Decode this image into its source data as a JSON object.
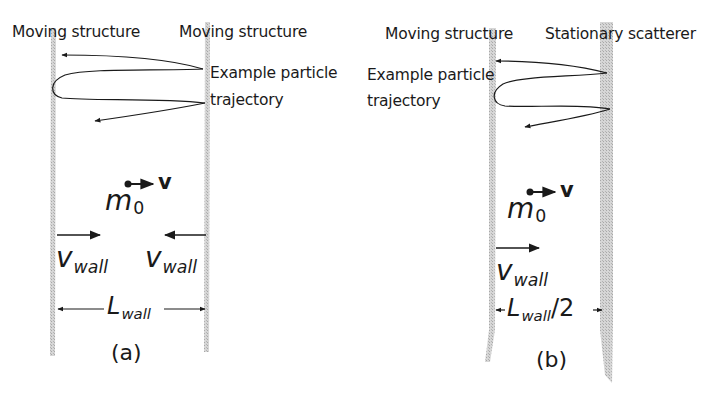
{
  "figure": {
    "panel_a": {
      "left_wall_label": "Moving structure",
      "right_wall_label": "Moving structure",
      "trajectory_label_line1": "Example particle",
      "trajectory_label_line2": "trajectory",
      "particle_mass": "m",
      "particle_mass_sub": "0",
      "velocity_symbol": "v",
      "left_wall_velocity": "v",
      "left_wall_velocity_sub": "wall",
      "right_wall_velocity": "v",
      "right_wall_velocity_sub": "wall",
      "separation": "L",
      "separation_sub": "wall",
      "separation_suffix": "",
      "caption": "(a)"
    },
    "panel_b": {
      "left_wall_label": "Moving structure",
      "right_wall_label": "Stationary scatterer",
      "trajectory_label_line1": "Example particle",
      "trajectory_label_line2": "trajectory",
      "particle_mass": "m",
      "particle_mass_sub": "0",
      "velocity_symbol": "v",
      "left_wall_velocity": "v",
      "left_wall_velocity_sub": "wall",
      "separation": "L",
      "separation_sub": "wall",
      "separation_suffix": "/2",
      "caption": "(b)"
    },
    "colors": {
      "wall_fill": "#c8c8c8",
      "ink": "#1a1a1a"
    }
  }
}
